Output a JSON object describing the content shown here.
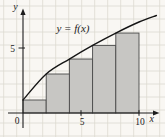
{
  "figure": {
    "annotation": "y = f(x)",
    "colors": {
      "background": "#f9f7f3",
      "grid": "#dcd9d1",
      "axis": "#1c1c1c",
      "curve": "#151515",
      "rect_fill": "#c7c6c3",
      "rect_border": "#4a4a4a",
      "text": "#1c1c1c"
    }
  },
  "chart_data": {
    "type": "area",
    "subtype": "riemann-sum-left-endpoint-rectangles",
    "title": "",
    "annotation": "y = f(x)",
    "grid": true,
    "x_axis": {
      "label": "x",
      "range": [
        0,
        11.6
      ],
      "ticks": [
        {
          "value": 0,
          "label": "0"
        },
        {
          "value": 5,
          "label": "5"
        },
        {
          "value": 10,
          "label": "10"
        }
      ]
    },
    "y_axis": {
      "label": "y",
      "range": [
        0,
        7.9
      ],
      "ticks": [
        {
          "value": 5,
          "label": "5"
        }
      ]
    },
    "curve_points": [
      [
        0,
        1
      ],
      [
        2,
        3
      ],
      [
        4,
        4.15
      ],
      [
        6,
        5.2
      ],
      [
        8,
        6.15
      ],
      [
        10,
        7
      ],
      [
        11.5,
        7.5
      ]
    ],
    "rectangles": [
      {
        "x0": 0,
        "x1": 2,
        "height": 1
      },
      {
        "x0": 2,
        "x1": 4,
        "height": 3
      },
      {
        "x0": 4,
        "x1": 6,
        "height": 4.15
      },
      {
        "x0": 6,
        "x1": 8,
        "height": 5.2
      },
      {
        "x0": 8,
        "x1": 10,
        "height": 6.15
      }
    ]
  }
}
